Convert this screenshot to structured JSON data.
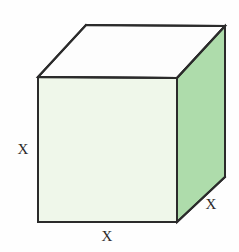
{
  "figure": {
    "kind": "cube-diagram",
    "canvas": {
      "width": 239,
      "height": 252,
      "background": "#fefefe"
    },
    "colors": {
      "front_face": "#eff7ea",
      "right_face": "#aedcab",
      "top_face": "#fdfdfd",
      "edge_stroke": "#2b2b2b",
      "label_text": "#2a2a2a"
    },
    "geometry": {
      "front_top_left": [
        38,
        77
      ],
      "front_top_right": [
        177,
        78
      ],
      "front_bottom_right": [
        177,
        222
      ],
      "front_bottom_left": [
        38,
        222
      ],
      "back_top_left": [
        86,
        25
      ],
      "back_top_right": [
        225,
        26
      ],
      "back_bottom_right": [
        225,
        177
      ],
      "edge_width": 2
    },
    "labels": {
      "left_edge": "X",
      "bottom_edge": "X",
      "depth_edge": "X"
    }
  }
}
